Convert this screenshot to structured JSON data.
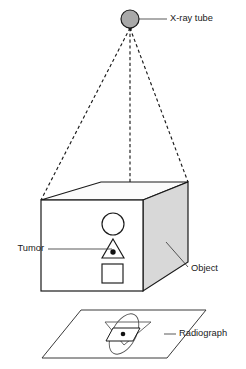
{
  "figure": {
    "background_color": "#ffffff",
    "line_color": "#1a1a1a",
    "shaded_face_color": "#d8d8d8",
    "tube_fill_color": "#a9a9a9",
    "width": 246,
    "height": 369
  },
  "labels": {
    "xray_tube": "X-ray tube",
    "tumor": "Tumor",
    "object": "Object",
    "radiograph": "Radiograph"
  },
  "components": {
    "source": {
      "name": "X-ray tube",
      "shape": "circle",
      "center_x": 130,
      "center_y": 19,
      "radius": 9,
      "fill": "#a9a9a9",
      "nozzle": "cone pointing down"
    },
    "beam": {
      "name": "X-ray beam",
      "style": "dashed",
      "ray_count": 3,
      "origin_x": 130,
      "origin_y": 28,
      "targets": [
        {
          "x": 41,
          "y": 200
        },
        {
          "x": 130,
          "y": 188
        },
        {
          "x": 188,
          "y": 182
        }
      ]
    },
    "object": {
      "name": "Object",
      "shape": "rectangular box",
      "front_face_fill": "#ffffff",
      "top_face_fill": "#fbfbfb",
      "side_face_fill": "#d8d8d8",
      "contents": [
        {
          "shape": "circle",
          "label": "circular inclusion"
        },
        {
          "shape": "triangle",
          "label": "triangular inclusion containing tumor"
        },
        {
          "shape": "square",
          "label": "square inclusion"
        }
      ],
      "tumor_marker": {
        "shape": "dot",
        "fill": "#111111",
        "inside": "triangle"
      }
    },
    "radiograph": {
      "name": "Radiograph",
      "shape": "parallelogram film plane",
      "projected_shapes": [
        {
          "shape": "ellipse",
          "from": "circle"
        },
        {
          "shape": "flattened triangle",
          "from": "triangle"
        },
        {
          "shape": "parallelogram",
          "from": "square"
        },
        {
          "shape": "dot",
          "from": "tumor"
        }
      ]
    }
  }
}
